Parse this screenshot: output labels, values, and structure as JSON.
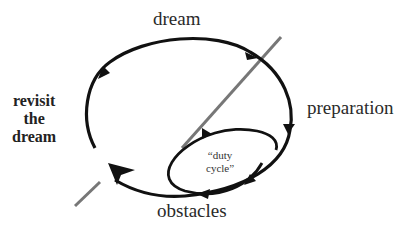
{
  "diagram": {
    "labels": {
      "top": "dream",
      "right": "preparation",
      "bottom": "obstacles",
      "left_line1": "revisit",
      "left_line2": "the",
      "left_line3": "dream",
      "inner_line1": "“duty",
      "inner_line2": "cycle”"
    },
    "colors": {
      "loop": "#111111",
      "diagonal_line": "#777777",
      "text": "#2a2a2a"
    }
  }
}
